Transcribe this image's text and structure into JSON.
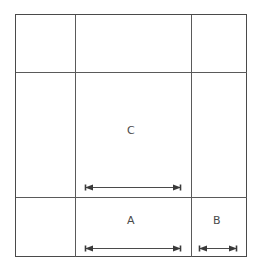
{
  "diagram": {
    "type": "technical-line-drawing",
    "canvas": {
      "width": 262,
      "height": 278
    },
    "colors": {
      "background": "#ffffff",
      "grid_line": "#5a5a5a",
      "outer_border": "#4a4a4a",
      "dimension_line": "#3a3a3a",
      "label_text": "#4a4a4a"
    },
    "outer_box": {
      "x": 15,
      "y": 14,
      "width": 232,
      "height": 243
    },
    "grid": {
      "vertical_lines": [
        75,
        191
      ],
      "horizontal_lines": [
        72,
        197
      ],
      "columns": 3,
      "rows": 3
    },
    "labels": [
      {
        "id": "label-c",
        "text": "C",
        "x": 131,
        "y": 130
      },
      {
        "id": "label-a",
        "text": "A",
        "x": 131,
        "y": 220
      },
      {
        "id": "label-b",
        "text": "B",
        "x": 217,
        "y": 220
      }
    ],
    "dimensions": [
      {
        "id": "dimension-c",
        "label": "C",
        "x1": 85,
        "x2": 181,
        "y": 187,
        "span_px": 96,
        "double_headed": true
      },
      {
        "id": "dimension-a",
        "label": "A",
        "x1": 85,
        "x2": 181,
        "y": 248,
        "span_px": 96,
        "double_headed": true
      },
      {
        "id": "dimension-b",
        "label": "B",
        "x1": 199,
        "x2": 237,
        "y": 248,
        "span_px": 38,
        "double_headed": true
      }
    ]
  }
}
